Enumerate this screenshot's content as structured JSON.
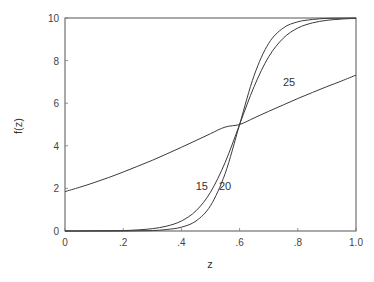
{
  "chart_data": {
    "type": "line",
    "title": "",
    "xlabel": "z",
    "ylabel": "f(z)",
    "xlim": [
      0,
      1.0
    ],
    "ylim": [
      0,
      10
    ],
    "grid": false,
    "legend": "none (inline curve labels)",
    "x_ticks": [
      "0",
      ".2",
      ".4",
      ".6",
      ".8",
      "1.0"
    ],
    "y_ticks": [
      "0",
      "2",
      "4",
      "6",
      "8",
      "10"
    ],
    "x": [
      0.0,
      0.05,
      0.1,
      0.15,
      0.2,
      0.25,
      0.3,
      0.35,
      0.4,
      0.45,
      0.5,
      0.55,
      0.6,
      0.65,
      0.7,
      0.75,
      0.8,
      0.85,
      0.9,
      0.95,
      1.0
    ],
    "series": [
      {
        "name": "15",
        "label_pos": [
          0.47,
          2.1
        ],
        "values": [
          0.0,
          0.0,
          0.01,
          0.01,
          0.02,
          0.05,
          0.11,
          0.23,
          0.47,
          0.95,
          1.82,
          3.21,
          5.0,
          6.79,
          8.18,
          9.05,
          9.53,
          9.77,
          9.89,
          9.95,
          9.98
        ]
      },
      {
        "name": "20",
        "label_pos": [
          0.55,
          2.1
        ],
        "values": [
          0.0,
          0.0,
          0.0,
          0.0,
          0.0,
          0.01,
          0.02,
          0.07,
          0.18,
          0.47,
          1.19,
          2.69,
          5.0,
          7.31,
          8.81,
          9.53,
          9.82,
          9.93,
          9.98,
          9.99,
          10.0
        ]
      },
      {
        "name": "25",
        "label_pos": [
          0.77,
          7.0
        ],
        "values": [
          1.85,
          2.05,
          2.27,
          2.51,
          2.77,
          3.04,
          3.32,
          3.62,
          3.93,
          4.25,
          4.57,
          4.88,
          5.0,
          5.31,
          5.62,
          5.92,
          6.22,
          6.5,
          6.78,
          7.04,
          7.32
        ]
      }
    ],
    "annotations": [
      "15",
      "20",
      "25"
    ]
  },
  "labels": {
    "xlabel": "z",
    "ylabel": "f(z)",
    "curve_labels": [
      "15",
      "20",
      "25"
    ]
  }
}
